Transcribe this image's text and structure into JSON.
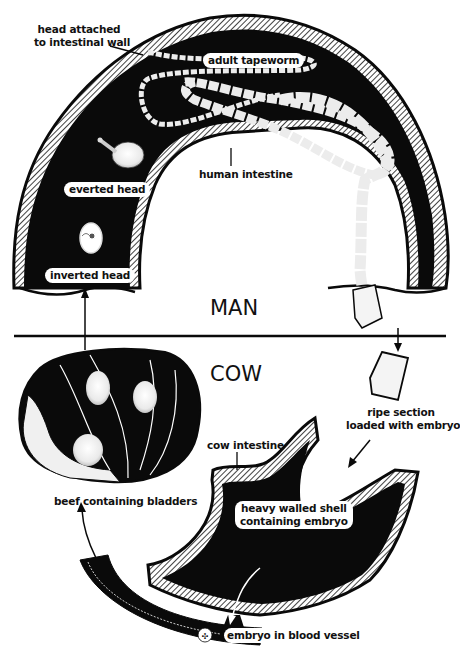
{
  "sections": {
    "top": "MAN",
    "bottom": "COW"
  },
  "labels": {
    "head_attached_line1": "head attached",
    "head_attached_line2": "to intestinal wall",
    "adult_tapeworm": "adult tapeworm",
    "human_intestine": "human intestine",
    "everted_head": "everted head",
    "inverted_head": "inverted head",
    "ripe_section_line1": "ripe section",
    "ripe_section_line2": "loaded with embryos",
    "cow_intestine": "cow intestine",
    "beef_containing_bladders": "beef containing bladders",
    "heavy_walled_line1": "heavy walled shell",
    "heavy_walled_line2": "containing embryo",
    "embryo_in_blood_vessel": "embryo in blood vessel"
  },
  "colors": {
    "ink": "#0a0a0a",
    "paper": "#ffffff",
    "segment": "#ececec"
  }
}
